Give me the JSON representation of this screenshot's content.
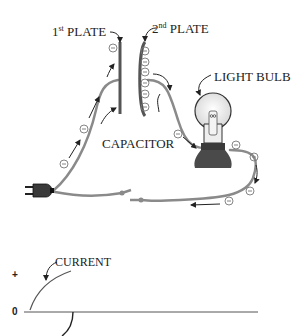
{
  "diagram": {
    "labels": {
      "first_plate_num": "1",
      "first_plate_sup": "st",
      "first_plate_text": " PLATE",
      "second_plate_num": "2",
      "second_plate_sup": "nd",
      "second_plate_text": " PLATE",
      "light_bulb": "LIGHT BULB",
      "capacitor": "CAPACITOR",
      "current": "CURRENT"
    },
    "electron_symbol": "⊖",
    "components": [
      "plug",
      "capacitor-plate-1",
      "capacitor-plate-2",
      "light-bulb",
      "switch",
      "wires"
    ],
    "graph": {
      "y_axis_labels": {
        "plus": "+",
        "zero": "0"
      },
      "curve_label": "CURRENT"
    },
    "colors": {
      "wire": "#8a8a8a",
      "plate": "#555555",
      "ink": "#222222",
      "bulb_base": "#3a3a3a"
    }
  }
}
